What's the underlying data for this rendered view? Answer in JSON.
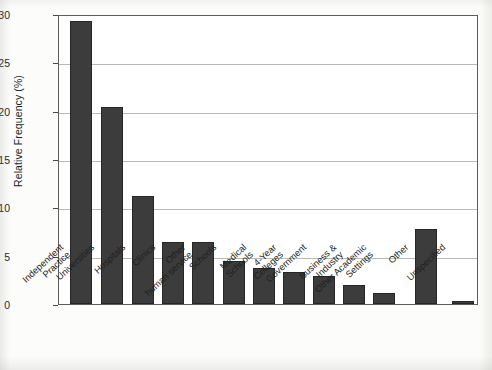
{
  "chart_data": {
    "type": "bar",
    "title": "",
    "xlabel": "",
    "ylabel": "Relative Frequency (%)",
    "ylim": [
      0,
      30
    ],
    "yticks": [
      0,
      5,
      10,
      15,
      20,
      25,
      30
    ],
    "ytick_labels": [
      "0",
      "5",
      "10",
      "15",
      "20",
      "25",
      "30"
    ],
    "grid": true,
    "legend": "none",
    "bar_color": "#3c3c3c",
    "categories": [
      "Independent Practice",
      "Universities",
      "Hospitals",
      "Clinics",
      "Other human service",
      "Schools",
      "Medical Schools",
      "4-Year Colleges",
      "Government",
      "Business & Industry",
      "Other Academic Settings",
      "Other",
      "Unspecified"
    ],
    "category_lines": [
      [
        "Independent",
        "Practice"
      ],
      [
        "Universities"
      ],
      [
        "Hospitals"
      ],
      [
        "Clinics"
      ],
      [
        "Other",
        "human service"
      ],
      [
        "Schools"
      ],
      [
        "Medical",
        "Schools"
      ],
      [
        "4-Year",
        "Colleges"
      ],
      [
        "Government"
      ],
      [
        "Business &",
        "Industry"
      ],
      [
        "Other Academic",
        "Settings"
      ],
      [
        "Other"
      ],
      [
        "Unspecified"
      ]
    ],
    "values": [
      29.3,
      20.4,
      11.2,
      6.4,
      6.4,
      4.4,
      3.7,
      3.3,
      2.9,
      2.0,
      1.1,
      7.8,
      0.3
    ]
  }
}
